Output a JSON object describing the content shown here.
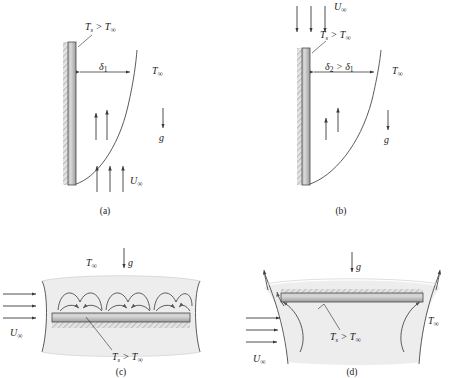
{
  "figure": {
    "background_color": "#ffffff",
    "plate_fill_top": "#d8d8d8",
    "plate_fill_bottom": "#9a9a9a",
    "plume_shade": "#ececec",
    "line_color": "#3a3a3a"
  },
  "panels": [
    {
      "id": "a",
      "caption": "(a)",
      "description": "Vertical heated plate with assisting upward external flow",
      "labels": {
        "surface_temp": "T",
        "surface_temp_sub": "s",
        "surface_temp_rel": " > T",
        "surface_temp_inf": "∞",
        "delta": "δ",
        "delta_sub": "1",
        "ambient": "T",
        "ambient_sub": "∞",
        "gravity": "g",
        "velocity": "U",
        "velocity_sub": "∞"
      },
      "flow_direction": "upward",
      "buoyancy_arrows": 2,
      "external_arrows": 3
    },
    {
      "id": "b",
      "caption": "(b)",
      "description": "Vertical heated plate with opposing downward external flow",
      "labels": {
        "surface_temp": "T",
        "surface_temp_sub": "s",
        "surface_temp_rel": " > T",
        "surface_temp_inf": "∞",
        "delta_expr_1": "δ",
        "delta_expr_1_sub": "2",
        "delta_expr_rel": " > ",
        "delta_expr_2": "δ",
        "delta_expr_2_sub": "1",
        "ambient": "T",
        "ambient_sub": "∞",
        "gravity": "g",
        "velocity": "U",
        "velocity_sub": "∞"
      },
      "flow_direction": "downward",
      "buoyancy_arrows": 2,
      "external_arrows": 3
    },
    {
      "id": "c",
      "caption": "(c)",
      "description": "Horizontal heated plate, heated side up, with cross flow and thermal plumes",
      "labels": {
        "ambient": "T",
        "ambient_sub": "∞",
        "gravity": "g",
        "velocity": "U",
        "velocity_sub": "∞",
        "surface_temp": "T",
        "surface_temp_sub": "s",
        "surface_temp_rel": " > T",
        "surface_temp_inf": "∞"
      },
      "plume_cells": 4,
      "external_arrows": 3
    },
    {
      "id": "d",
      "caption": "(d)",
      "description": "Horizontal heated plate, heated side down, with cross flow and edge plumes",
      "labels": {
        "gravity": "g",
        "velocity": "U",
        "velocity_sub": "∞",
        "surface_temp": "T",
        "surface_temp_sub": "s",
        "surface_temp_rel": " > T",
        "surface_temp_inf": "∞",
        "ambient": "T",
        "ambient_sub": "∞"
      },
      "edge_plumes": 2,
      "external_arrows": 3
    }
  ]
}
